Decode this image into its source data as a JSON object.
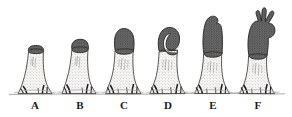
{
  "figure": {
    "background_color": "#ffffff",
    "width": 292,
    "height": 117,
    "ink_color": "#2b2b2b",
    "cap_color": "#5f5f5f",
    "cap_shadow_color": "#3f3f3f",
    "stalk_color": "#f2f1ef",
    "stipple_color": "#7a7a7a",
    "ground_line_color": "#8c8c8c",
    "label_color": "#1a1a1a",
    "caption": ""
  },
  "ground": {
    "name": "substrate-line",
    "y": 95,
    "x_start": 8,
    "x_end": 286
  },
  "stages": [
    {
      "id": "A",
      "label": "A",
      "label_x": 35,
      "stalk_top_y": 47,
      "base_y": 94,
      "total_height_px": 47,
      "cap_height_px": 7,
      "cap_form": "flat-knob",
      "axis_x": 35,
      "stalk_width_px": 17,
      "rhizoid_count": 5
    },
    {
      "id": "B",
      "label": "B",
      "label_x": 80,
      "stalk_top_y": 41,
      "base_y": 94,
      "total_height_px": 53,
      "cap_height_px": 13,
      "cap_form": "rounded-dome",
      "axis_x": 80,
      "stalk_width_px": 18,
      "rhizoid_count": 5
    },
    {
      "id": "C",
      "label": "C",
      "label_x": 124,
      "stalk_top_y": 30,
      "base_y": 94,
      "total_height_px": 64,
      "cap_height_px": 22,
      "cap_form": "elongate-club",
      "axis_x": 126,
      "stalk_width_px": 20,
      "rhizoid_count": 6
    },
    {
      "id": "D",
      "label": "D",
      "label_x": 168,
      "stalk_top_y": 27,
      "base_y": 94,
      "total_height_px": 67,
      "cap_height_px": 30,
      "cap_form": "recurved-hook",
      "axis_x": 170,
      "stalk_width_px": 21,
      "rhizoid_count": 6
    },
    {
      "id": "E",
      "label": "E",
      "label_x": 213,
      "stalk_top_y": 16,
      "base_y": 94,
      "total_height_px": 78,
      "cap_height_px": 41,
      "cap_form": "lobed-column",
      "axis_x": 214,
      "stalk_width_px": 21,
      "rhizoid_count": 6
    },
    {
      "id": "F",
      "label": "F",
      "label_x": 258,
      "stalk_top_y": 6,
      "base_y": 94,
      "total_height_px": 88,
      "cap_height_px": 52,
      "cap_form": "branched-antler",
      "axis_x": 259,
      "stalk_width_px": 21,
      "rhizoid_count": 6,
      "branch_count": 4
    }
  ]
}
